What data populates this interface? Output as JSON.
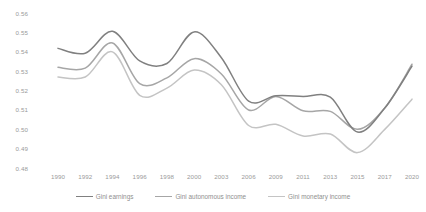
{
  "chart_data": {
    "type": "line",
    "title": "",
    "subtitle": "",
    "xlabel": "",
    "ylabel": "",
    "grid": false,
    "legend_position": "bottom",
    "categories": [
      "1990",
      "1992",
      "1994",
      "1996",
      "1998",
      "2000",
      "2003",
      "2006",
      "2009",
      "2011",
      "2013",
      "2015",
      "2017",
      "2020"
    ],
    "x_tick_labels": [
      "1990",
      "1992",
      "1994",
      "1996",
      "1998",
      "2000",
      "2003",
      "2006",
      "2009",
      "2011",
      "2013",
      "2015",
      "2017",
      "2020"
    ],
    "y_tick_labels": [
      "0.56",
      "0.55",
      "0.54",
      "0.53",
      "0.52",
      "0.51",
      "0.50",
      "0.49",
      "0.48"
    ],
    "y_tick_values": [
      0.56,
      0.55,
      0.54,
      0.53,
      0.52,
      0.51,
      0.5,
      0.49,
      0.48
    ],
    "ylim": [
      0.48,
      0.56
    ],
    "series": [
      {
        "name": "Gini earnings",
        "color": "#808080",
        "values": [
          0.542,
          0.5395,
          0.5508,
          0.5355,
          0.5342,
          0.5505,
          0.5372,
          0.5148,
          0.5175,
          0.5172,
          0.5168,
          0.4988,
          0.5112,
          0.5328
        ]
      },
      {
        "name": "Gini autonomous income",
        "color": "#a6a6a6",
        "values": [
          0.5322,
          0.5318,
          0.5448,
          0.5238,
          0.5268,
          0.5367,
          0.5288,
          0.5102,
          0.5172,
          0.5098,
          0.5095,
          0.5002,
          0.5112,
          0.5338
        ]
      },
      {
        "name": "Gini monetary income",
        "color": "#c4c4c4",
        "values": [
          0.5272,
          0.5272,
          0.5402,
          0.5178,
          0.5215,
          0.5308,
          0.5232,
          0.5022,
          0.5028,
          0.4968,
          0.4978,
          0.4882,
          0.5002,
          0.5158
        ]
      }
    ]
  },
  "legend": {
    "items": [
      {
        "label": "Gini earnings",
        "color": "#808080"
      },
      {
        "label": "Gini autonomous income",
        "color": "#a6a6a6"
      },
      {
        "label": "Gini monetary income",
        "color": "#c4c4c4"
      }
    ]
  }
}
